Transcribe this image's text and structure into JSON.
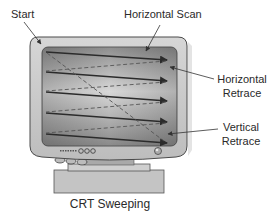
{
  "diagram": {
    "caption": "CRT Sweeping",
    "labels": {
      "start": "Start",
      "horizontal_scan": "Horizontal Scan",
      "horizontal_retrace_line1": "Horizontal",
      "horizontal_retrace_line2": "Retrace",
      "vertical_retrace_line1": "Vertical",
      "vertical_retrace_line2": "Retrace"
    },
    "scan_lines": 5,
    "colors": {
      "case": "#c9c9c9",
      "case_outline": "#4a4a4a",
      "screen_edge": "#8c8c8c",
      "screen_center": "#d6d6d6",
      "scan_line": "#2b2b2b",
      "retrace_line": "#555555"
    }
  }
}
